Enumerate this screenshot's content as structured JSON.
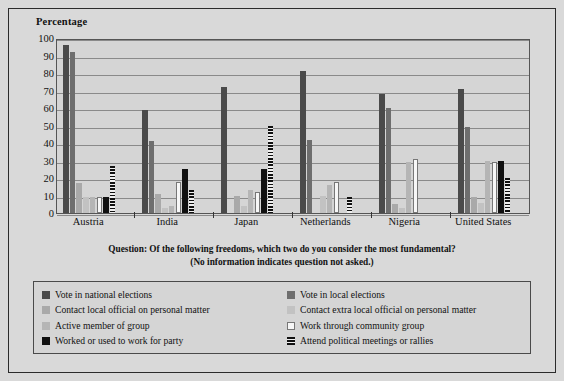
{
  "chart": {
    "y_axis_title": "Percentage",
    "caption_line1": "Question: Of the following freedoms, which two do you consider the most fundamental?",
    "caption_line2": "(No information indicates question not asked.)"
  },
  "chart_data": {
    "type": "bar",
    "title": "",
    "subtitle": "",
    "xlabel": "",
    "ylabel": "Percentage",
    "ylim": [
      0,
      100
    ],
    "yticks": [
      0,
      10,
      20,
      30,
      40,
      50,
      60,
      70,
      80,
      90,
      100
    ],
    "grid": true,
    "legend_position": "bottom",
    "categories": [
      "Austria",
      "India",
      "Japan",
      "Netherlands",
      "Nigeria",
      "United States"
    ],
    "series": [
      {
        "name": "Vote in national elections",
        "color": "#4a4a4a",
        "values": [
          96,
          59,
          72,
          81,
          68,
          71
        ]
      },
      {
        "name": "Vote in local elections",
        "color": "#6e6e6e",
        "values": [
          92,
          41,
          null,
          42,
          60,
          49
        ]
      },
      {
        "name": "Contact local official on personal matter",
        "color": "#a9a9a9",
        "values": [
          17,
          11,
          10,
          null,
          5,
          9
        ]
      },
      {
        "name": "Contact extra local official on personal matter",
        "color": "#c2c2c2",
        "values": [
          9,
          3,
          4,
          10,
          3,
          6
        ]
      },
      {
        "name": "Active member of group",
        "color": "#b5b5b5",
        "values": [
          9,
          4,
          13,
          16,
          29,
          30
        ]
      },
      {
        "name": "Work through community group",
        "color": "#f7f7f7",
        "values": [
          9,
          18,
          12,
          18,
          31,
          29
        ]
      },
      {
        "name": "Worked or used to work for party",
        "color": "#111111",
        "values": [
          9,
          25,
          25,
          null,
          null,
          30
        ]
      },
      {
        "name": "Attend political meetings or rallies",
        "color": "#111111",
        "values": [
          27,
          13,
          50,
          9,
          null,
          20
        ]
      }
    ]
  },
  "legend": {
    "left_items": [
      "Vote in national elections",
      "Contact local official on personal matter",
      "Active member of group",
      "Worked or used to work for party"
    ],
    "right_items": [
      "Vote in local elections",
      "Contact extra local official on personal matter",
      "Work through community group",
      "Attend political meetings or rallies"
    ]
  }
}
